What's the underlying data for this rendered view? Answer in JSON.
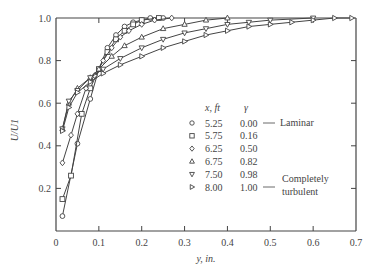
{
  "chart_data": {
    "type": "line",
    "title": "",
    "xlabel": "y, in.",
    "ylabel": "U/U1",
    "xlim": [
      0,
      0.7
    ],
    "ylim": [
      0,
      1.0
    ],
    "grid": false,
    "xticks": [
      "0",
      "0.1",
      "0.2",
      "0.3",
      "0.4",
      "0.5",
      "0.6",
      "0.7"
    ],
    "yticks": [
      "0.2",
      "0.4",
      "0.6",
      "0.8",
      "1.0"
    ],
    "legend": {
      "position": "inside-right",
      "header_x": "x, ft",
      "header_gamma": "γ",
      "annotation_laminar": "Laminar",
      "annotation_turbulent_1": "Completely",
      "annotation_turbulent_2": "turbulent"
    },
    "series": [
      {
        "name": "x=5.25 ft, γ=0.00",
        "x_ft": "5.25",
        "gamma": "0.00",
        "marker": "circle",
        "points": [
          [
            0.015,
            0.07
          ],
          [
            0.05,
            0.41
          ],
          [
            0.08,
            0.62
          ],
          [
            0.1,
            0.76
          ],
          [
            0.12,
            0.86
          ],
          [
            0.14,
            0.92
          ],
          [
            0.16,
            0.96
          ],
          [
            0.18,
            0.98
          ],
          [
            0.2,
            0.99
          ],
          [
            0.22,
            1.0
          ],
          [
            0.25,
            1.0
          ]
        ]
      },
      {
        "name": "x=5.75 ft, γ=0.16",
        "x_ft": "5.75",
        "gamma": "0.16",
        "marker": "square",
        "points": [
          [
            0.015,
            0.15
          ],
          [
            0.035,
            0.26
          ],
          [
            0.06,
            0.55
          ],
          [
            0.08,
            0.67
          ],
          [
            0.1,
            0.76
          ],
          [
            0.12,
            0.84
          ],
          [
            0.14,
            0.9
          ],
          [
            0.16,
            0.94
          ],
          [
            0.18,
            0.97
          ],
          [
            0.2,
            0.99
          ],
          [
            0.24,
            1.0
          ]
        ]
      },
      {
        "name": "x=6.25 ft, γ=0.50",
        "x_ft": "6.25",
        "gamma": "0.50",
        "marker": "diamond",
        "points": [
          [
            0.015,
            0.32
          ],
          [
            0.035,
            0.45
          ],
          [
            0.05,
            0.55
          ],
          [
            0.07,
            0.67
          ],
          [
            0.09,
            0.73
          ],
          [
            0.11,
            0.8
          ],
          [
            0.13,
            0.86
          ],
          [
            0.15,
            0.91
          ],
          [
            0.17,
            0.94
          ],
          [
            0.2,
            0.97
          ],
          [
            0.23,
            0.99
          ],
          [
            0.27,
            1.0
          ]
        ]
      },
      {
        "name": "x=6.75 ft, γ=0.82",
        "x_ft": "6.75",
        "gamma": "0.82",
        "marker": "triangle-up",
        "points": [
          [
            0.015,
            0.48
          ],
          [
            0.03,
            0.6
          ],
          [
            0.05,
            0.67
          ],
          [
            0.08,
            0.72
          ],
          [
            0.1,
            0.76
          ],
          [
            0.13,
            0.82
          ],
          [
            0.16,
            0.87
          ],
          [
            0.2,
            0.91
          ],
          [
            0.25,
            0.95
          ],
          [
            0.3,
            0.97
          ],
          [
            0.35,
            0.99
          ],
          [
            0.4,
            1.0
          ]
        ]
      },
      {
        "name": "x=7.50 ft, γ=0.98",
        "x_ft": "7.50",
        "gamma": "0.98",
        "marker": "triangle-down",
        "points": [
          [
            0.015,
            0.48
          ],
          [
            0.03,
            0.61
          ],
          [
            0.05,
            0.66
          ],
          [
            0.08,
            0.72
          ],
          [
            0.11,
            0.76
          ],
          [
            0.15,
            0.81
          ],
          [
            0.2,
            0.86
          ],
          [
            0.25,
            0.9
          ],
          [
            0.3,
            0.93
          ],
          [
            0.35,
            0.95
          ],
          [
            0.4,
            0.97
          ],
          [
            0.45,
            0.98
          ],
          [
            0.5,
            0.99
          ],
          [
            0.6,
            1.0
          ]
        ]
      },
      {
        "name": "x=8.00 ft, γ=1.00",
        "x_ft": "8.00",
        "gamma": "1.00",
        "marker": "triangle-right",
        "points": [
          [
            0.015,
            0.47
          ],
          [
            0.03,
            0.58
          ],
          [
            0.05,
            0.65
          ],
          [
            0.08,
            0.7
          ],
          [
            0.11,
            0.74
          ],
          [
            0.15,
            0.78
          ],
          [
            0.2,
            0.82
          ],
          [
            0.25,
            0.86
          ],
          [
            0.3,
            0.89
          ],
          [
            0.35,
            0.92
          ],
          [
            0.4,
            0.94
          ],
          [
            0.45,
            0.96
          ],
          [
            0.5,
            0.97
          ],
          [
            0.55,
            0.98
          ],
          [
            0.6,
            0.99
          ],
          [
            0.65,
            1.0
          ],
          [
            0.69,
            1.0
          ]
        ]
      }
    ]
  }
}
